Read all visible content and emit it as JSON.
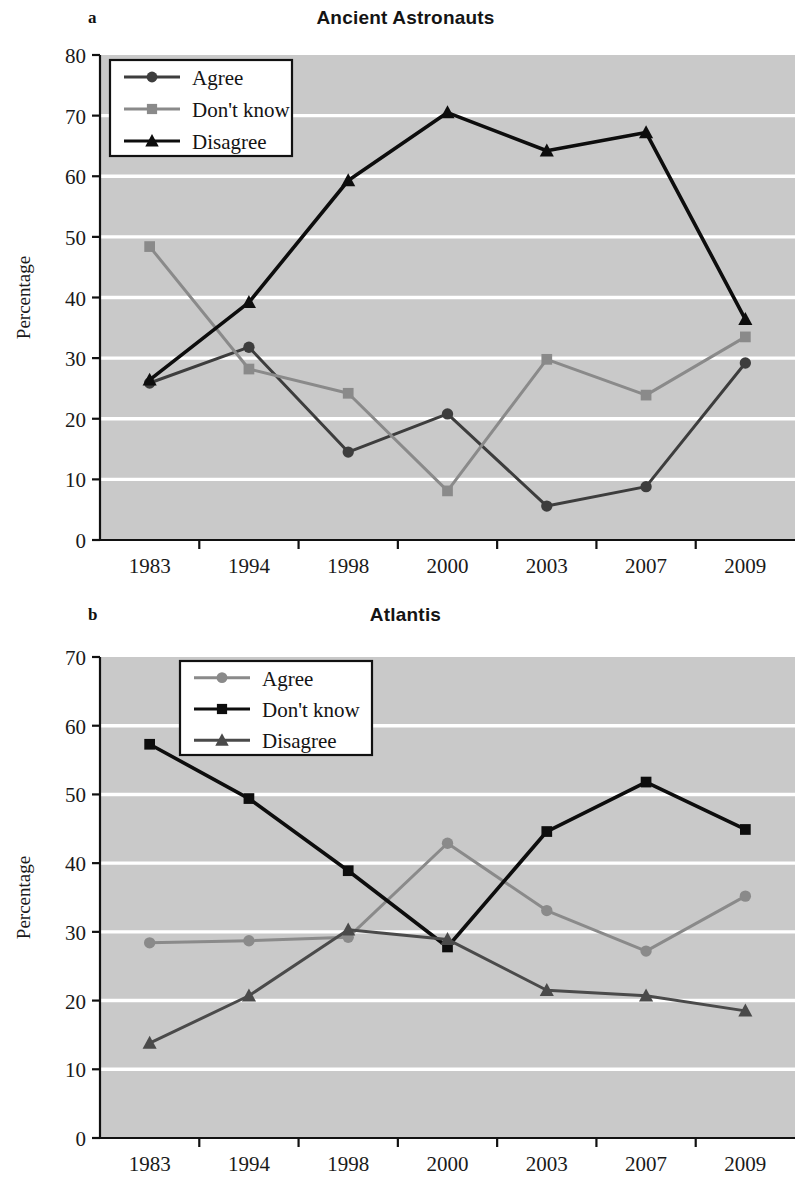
{
  "figure": {
    "panels": [
      {
        "letter": "a",
        "title": "Ancient Astronauts"
      },
      {
        "letter": "b",
        "title": "Atlantis"
      }
    ]
  },
  "chart_data": [
    {
      "type": "line",
      "panel": "a",
      "title": "Ancient Astronauts",
      "xlabel": "",
      "ylabel": "Percentage",
      "categories": [
        "1983",
        "1994",
        "1998",
        "2000",
        "2003",
        "2007",
        "2009"
      ],
      "x": [
        "1983",
        "1994",
        "1998",
        "2000",
        "2003",
        "2007",
        "2009"
      ],
      "ylim": [
        0,
        80
      ],
      "yticks": [
        0,
        10,
        20,
        30,
        40,
        50,
        60,
        70,
        80
      ],
      "grid": "horizontal-white",
      "legend_position": "upper-left-inside",
      "plot_background": "#c9c9c9",
      "series": [
        {
          "name": "Agree",
          "marker": "circle",
          "color": "#3d3d3d",
          "values": [
            25.9,
            31.8,
            14.5,
            20.8,
            5.6,
            8.8,
            29.2
          ]
        },
        {
          "name": "Don't know",
          "marker": "square",
          "color": "#8a8a8a",
          "values": [
            48.4,
            28.2,
            24.2,
            8.1,
            29.8,
            23.9,
            33.5
          ]
        },
        {
          "name": "Disagree",
          "marker": "triangle",
          "color": "#0d0d0d",
          "values": [
            26.4,
            39.2,
            59.3,
            70.5,
            64.2,
            67.2,
            36.4
          ]
        }
      ]
    },
    {
      "type": "line",
      "panel": "b",
      "title": "Atlantis",
      "xlabel": "",
      "ylabel": "Percentage",
      "categories": [
        "1983",
        "1994",
        "1998",
        "2000",
        "2003",
        "2007",
        "2009"
      ],
      "x": [
        "1983",
        "1994",
        "1998",
        "2000",
        "2003",
        "2007",
        "2009"
      ],
      "ylim": [
        0,
        70
      ],
      "yticks": [
        0,
        10,
        20,
        30,
        40,
        50,
        60,
        70
      ],
      "grid": "horizontal-white",
      "legend_position": "upper-center-inside",
      "plot_background": "#c9c9c9",
      "series": [
        {
          "name": "Agree",
          "marker": "circle",
          "color": "#8a8a8a",
          "values": [
            28.4,
            28.7,
            29.2,
            42.9,
            33.1,
            27.2,
            35.2
          ]
        },
        {
          "name": "Don't know",
          "marker": "square",
          "color": "#0d0d0d",
          "values": [
            57.3,
            49.4,
            38.9,
            27.8,
            44.6,
            51.8,
            44.9
          ]
        },
        {
          "name": "Disagree",
          "marker": "triangle",
          "color": "#4a4a4a",
          "values": [
            13.8,
            20.7,
            30.3,
            28.9,
            21.5,
            20.7,
            18.5
          ]
        }
      ]
    }
  ]
}
